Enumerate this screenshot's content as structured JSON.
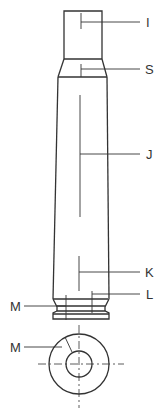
{
  "diagram": {
    "stroke_color": "#333333",
    "labels": [
      {
        "id": "I",
        "text": "I",
        "part": "neck"
      },
      {
        "id": "S",
        "text": "S",
        "part": "shoulder"
      },
      {
        "id": "J",
        "text": "J",
        "part": "body"
      },
      {
        "id": "K",
        "text": "K",
        "part": "lower-body"
      },
      {
        "id": "L",
        "text": "L",
        "part": "base"
      },
      {
        "id": "M1",
        "text": "M",
        "part": "rim"
      },
      {
        "id": "M2",
        "text": "M",
        "part": "head-face"
      }
    ]
  }
}
